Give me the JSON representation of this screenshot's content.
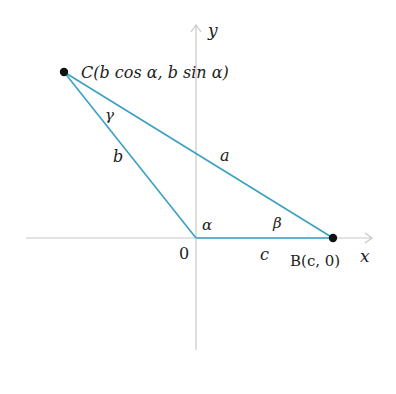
{
  "figure": {
    "colors": {
      "triangle": "#3aa0c4",
      "axis": "#c8c8c8",
      "point": "#111111",
      "text": "#222222"
    },
    "axes": {
      "x_label": "x",
      "y_label": "y",
      "origin_label": "0"
    },
    "points": {
      "C": {
        "label": "C(b cos α, b sin α)"
      },
      "B": {
        "label": "B(c, 0)"
      }
    },
    "sides": {
      "a": "a",
      "b": "b",
      "c": "c"
    },
    "angles": {
      "alpha": "α",
      "beta": "β",
      "gamma": "γ"
    }
  }
}
